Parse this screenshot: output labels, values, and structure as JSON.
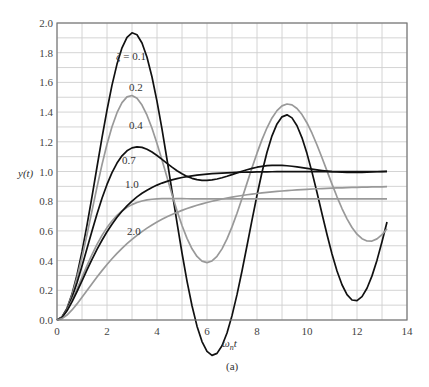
{
  "chart_data": {
    "type": "line",
    "title": "",
    "xlabel": "ω_n t",
    "ylabel": "y(t)",
    "caption": "(a)",
    "xlim": [
      0,
      14
    ],
    "ylim": [
      0.0,
      2.0
    ],
    "x_ticks": [
      0,
      2,
      4,
      6,
      8,
      10,
      12,
      14
    ],
    "y_ticks": [
      "0.0",
      "0.2",
      "0.4",
      "0.6",
      "0.8",
      "1.0",
      "1.2",
      "1.4",
      "1.6",
      "1.8",
      "2.0"
    ],
    "grid": true,
    "grid_step_x": 1,
    "grid_step_y": 0.1,
    "legend": "inline labels",
    "zeta_symbol": "ζ",
    "x": [
      0.0,
      0.2,
      0.4,
      0.6,
      0.8,
      1.0,
      1.2,
      1.4,
      1.6,
      1.8,
      2.0,
      2.2,
      2.4,
      2.6,
      2.8,
      3.0,
      3.2,
      3.4,
      3.6,
      3.8,
      4.0,
      4.2,
      4.4,
      4.6,
      4.8,
      5.0,
      5.2,
      5.4,
      5.6,
      5.8,
      6.0,
      6.2,
      6.4,
      6.6,
      6.8,
      7.0,
      7.2,
      7.4,
      7.6,
      7.8,
      8.0,
      8.2,
      8.4,
      8.6,
      8.8,
      9.0,
      9.2,
      9.4,
      9.6,
      9.8,
      10.0,
      10.2,
      10.4,
      10.6,
      10.8,
      11.0,
      11.2,
      11.4,
      11.6,
      11.8,
      12.0,
      12.2,
      12.4,
      12.6,
      12.8,
      13.0,
      13.2
    ],
    "series": [
      {
        "name": "ζ = 0.1",
        "zeta": 0.1,
        "color": "#111111",
        "label": "ζ = 0.1",
        "label_pos": [
          116,
          60
        ],
        "values": [
          0.0,
          0.0199,
          0.0787,
          0.1744,
          0.3032,
          0.46,
          0.6385,
          0.8313,
          1.0304,
          1.2274,
          1.4139,
          1.5817,
          1.7234,
          1.8325,
          1.9038,
          1.9338,
          1.9207,
          1.865,
          1.7688,
          1.6361,
          1.4726,
          1.2849,
          1.0808,
          0.8683,
          0.6557,
          0.4512,
          0.2623,
          0.096,
          -0.0414,
          -0.145,
          -0.2112,
          -0.238,
          -0.2249,
          -0.1735,
          -0.0872,
          0.0294,
          0.1707,
          0.3301,
          0.5,
          0.6726,
          0.84,
          0.9947,
          1.1299,
          1.2399,
          1.3203,
          1.368,
          1.3815,
          1.361,
          1.3083,
          1.2266,
          1.1205,
          0.9956,
          0.8584,
          0.7159,
          0.5757,
          0.4448,
          0.3301,
          0.2373,
          0.1711,
          0.1348,
          0.1301,
          0.157,
          0.2137,
          0.2971,
          0.4031,
          0.5263,
          0.6603
        ]
      },
      {
        "name": "ζ = 0.2",
        "zeta": 0.2,
        "color": "#999999",
        "label": "0.2",
        "label_pos": [
          129,
          91
        ],
        "values": [
          0.0,
          0.0196,
          0.0764,
          0.1664,
          0.2841,
          0.423,
          0.5761,
          0.7359,
          0.895,
          1.0464,
          1.1838,
          1.3018,
          1.3961,
          1.4635,
          1.5022,
          1.5116,
          1.4926,
          1.4473,
          1.3789,
          1.2911,
          1.1887,
          1.077,
          0.9611,
          0.846,
          0.7363,
          0.6363,
          0.5497,
          0.4795,
          0.428,
          0.3968,
          0.3867,
          0.3977,
          0.429,
          0.4791,
          0.546,
          0.627,
          0.719,
          0.8185,
          0.9217,
          1.0247,
          1.1236,
          1.2146,
          1.2945,
          1.3604,
          1.41,
          1.4417,
          1.4547,
          1.4488,
          1.4246,
          1.3834,
          1.327,
          1.2578,
          1.1787,
          1.0929,
          1.0039,
          0.915,
          0.8296,
          0.7508,
          0.6812,
          0.623,
          0.578,
          0.5475,
          0.5321,
          0.5318,
          0.5463,
          0.5744,
          0.6145
        ]
      },
      {
        "name": "ζ = 0.4",
        "zeta": 0.4,
        "color": "#111111",
        "label": "0.4",
        "label_pos": [
          129,
          129
        ],
        "values": [
          0.0,
          0.0192,
          0.0721,
          0.1517,
          0.251,
          0.363,
          0.4813,
          0.6,
          0.7141,
          0.8194,
          0.9129,
          0.9925,
          1.0568,
          1.1056,
          1.1393,
          1.159,
          1.1661,
          1.1624,
          1.15,
          1.1311,
          1.1077,
          1.0818,
          1.0551,
          1.0292,
          1.0053,
          0.9844,
          0.9671,
          0.954,
          0.9452,
          0.9406,
          0.9401,
          0.9432,
          0.9493,
          0.9578,
          0.9679,
          0.979,
          0.9905,
          1.0017,
          1.012,
          1.0212,
          1.0289,
          1.0349,
          1.0391,
          1.0415,
          1.0421,
          1.0412,
          1.0388,
          1.0353,
          1.031,
          1.0261,
          1.0209,
          1.0157,
          1.0108,
          1.0063,
          1.0024,
          0.9991,
          0.9966,
          0.9949,
          0.9939,
          0.9936,
          0.9939,
          0.9946,
          0.9957,
          0.997,
          0.9984,
          0.9998,
          1.0011
        ]
      },
      {
        "name": "ζ = 0.7",
        "zeta": 0.7,
        "color": "#999999",
        "label": "0.7",
        "label_pos": [
          122,
          164
        ],
        "values": [
          0.0,
          0.0185,
          0.066,
          0.132,
          0.2081,
          0.2879,
          0.3666,
          0.441,
          0.509,
          0.5696,
          0.6223,
          0.667,
          0.7042,
          0.7344,
          0.7584,
          0.777,
          0.7911,
          0.8013,
          0.8085,
          0.8132,
          0.816,
          0.8175,
          0.818,
          0.8179,
          0.8175,
          0.8169,
          0.8164,
          0.8159,
          0.8155,
          0.8153,
          0.8152,
          0.8152,
          0.8153,
          0.8154,
          0.8156,
          0.8158,
          0.8159,
          0.8161,
          0.8162,
          0.8163,
          0.8163,
          0.8163,
          0.8163,
          0.8163,
          0.8163,
          0.8163,
          0.8163,
          0.8163,
          0.8163,
          0.8163,
          0.8163,
          0.8163,
          0.8163,
          0.8163,
          0.8163,
          0.8163,
          0.8163,
          0.8163,
          0.8163,
          0.8163,
          0.8163,
          0.8163,
          0.8163,
          0.8163,
          0.8163,
          0.8163,
          0.8163
        ]
      },
      {
        "name": "ζ = 1.0",
        "zeta": 1.0,
        "color": "#111111",
        "label": "1.0",
        "label_pos": [
          125,
          188
        ],
        "values": [
          0.0,
          0.0175,
          0.0616,
          0.1219,
          0.1912,
          0.2642,
          0.3374,
          0.4082,
          0.4751,
          0.5372,
          0.594,
          0.6454,
          0.6916,
          0.7326,
          0.7689,
          0.8009,
          0.8288,
          0.8532,
          0.8743,
          0.8926,
          0.9084,
          0.922,
          0.9337,
          0.9437,
          0.9523,
          0.9596,
          0.9658,
          0.9711,
          0.9756,
          0.9794,
          0.9826,
          0.9854,
          0.9877,
          0.9897,
          0.9913,
          0.9927,
          0.9939,
          0.9949,
          0.9957,
          0.9964,
          0.997,
          0.9975,
          0.9979,
          0.9982,
          0.9985,
          0.9988,
          0.999,
          0.9992,
          0.9993,
          0.9994,
          0.9995,
          0.9996,
          0.9997,
          0.9997,
          0.9998,
          0.9998,
          0.9999,
          0.9999,
          0.9999,
          0.9999,
          0.9999,
          1.0,
          1.0,
          1.0,
          1.0,
          1.0,
          1.0
        ]
      },
      {
        "name": "ζ = 2.0",
        "zeta": 2.0,
        "color": "#999999",
        "label": "2.0",
        "label_pos": [
          127,
          235
        ],
        "values": [
          0.0,
          0.0092,
          0.0333,
          0.0677,
          0.1085,
          0.1529,
          0.1987,
          0.2446,
          0.2895,
          0.3326,
          0.3737,
          0.4124,
          0.4487,
          0.4825,
          0.514,
          0.5432,
          0.5703,
          0.5953,
          0.6185,
          0.6399,
          0.6597,
          0.678,
          0.6949,
          0.7105,
          0.725,
          0.7383,
          0.7507,
          0.7621,
          0.7727,
          0.7824,
          0.7914,
          0.7998,
          0.8075,
          0.8146,
          0.8213,
          0.8274,
          0.8331,
          0.8384,
          0.8433,
          0.8478,
          0.852,
          0.8559,
          0.8595,
          0.8628,
          0.8659,
          0.8688,
          0.8714,
          0.8739,
          0.8762,
          0.8783,
          0.8802,
          0.882,
          0.8837,
          0.8853,
          0.8867,
          0.888,
          0.8893,
          0.8904,
          0.8915,
          0.8925,
          0.8934,
          0.8943,
          0.8951,
          0.8958,
          0.8965,
          0.8971,
          0.8977
        ]
      }
    ]
  }
}
